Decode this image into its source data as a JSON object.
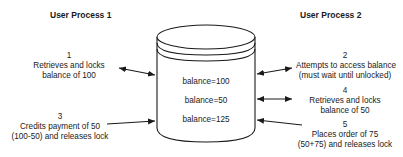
{
  "process1": {
    "title": "User Process 1",
    "steps": [
      {
        "num": "1",
        "line1": "Retrieves and locks",
        "line2": "balance of 100"
      },
      {
        "num": "3",
        "line1": "Credits payment of 50",
        "line2": "(100-50) and releases lock"
      }
    ]
  },
  "process2": {
    "title": "User Process 2",
    "steps": [
      {
        "num": "2",
        "line1": "Attempts to access balance",
        "line2": "(must wait until unlocked)"
      },
      {
        "num": "4",
        "line1": "Retrieves and locks",
        "line2": "balance of 50"
      },
      {
        "num": "5",
        "line1": "Places order of 75",
        "line2": "(50+75) and releases lock"
      }
    ]
  },
  "database": {
    "values": [
      "balance=100",
      "balance=50",
      "balance=125"
    ]
  },
  "colors": {
    "stroke": "#1a1a1a",
    "background": "#ffffff"
  }
}
